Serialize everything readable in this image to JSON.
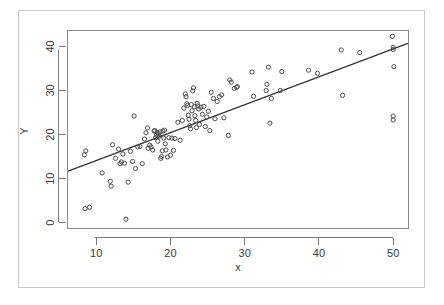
{
  "chart_data": {
    "type": "scatter",
    "title": "",
    "subtitle": "",
    "xlabel": "x",
    "ylabel": "Y",
    "xlim": [
      6.2,
      52.0
    ],
    "ylim": [
      -1.2,
      43.5
    ],
    "xticks": [
      10,
      20,
      30,
      40,
      50
    ],
    "yticks": [
      0,
      10,
      20,
      30,
      40
    ],
    "xtick_labels": [
      "10",
      "20",
      "30",
      "40",
      "50"
    ],
    "ytick_labels": [
      "0",
      "10",
      "20",
      "30",
      "40"
    ],
    "grid": false,
    "legend": "none",
    "marker": "open-circle",
    "marker_color": "#4d4d4d",
    "line_color": "#2b2b2b",
    "background": "#ffffff",
    "frame_color": "#8a8a8a",
    "outer_frame_color": "#c9c9c9",
    "series": [
      {
        "name": "observations",
        "type": "scatter",
        "points": [
          [
            8.4,
            15.4
          ],
          [
            8.6,
            16.3
          ],
          [
            8.5,
            3.2
          ],
          [
            9.1,
            3.5
          ],
          [
            10.8,
            11.3
          ],
          [
            11.9,
            9.4
          ],
          [
            12.0,
            8.3
          ],
          [
            12.2,
            17.7
          ],
          [
            12.6,
            14.6
          ],
          [
            13.0,
            16.7
          ],
          [
            13.2,
            13.4
          ],
          [
            13.4,
            13.8
          ],
          [
            13.6,
            15.6
          ],
          [
            13.8,
            13.5
          ],
          [
            14.0,
            0.8
          ],
          [
            14.3,
            9.2
          ],
          [
            14.6,
            16.2
          ],
          [
            14.9,
            13.9
          ],
          [
            15.1,
            24.2
          ],
          [
            15.3,
            12.3
          ],
          [
            15.6,
            17.2
          ],
          [
            15.9,
            17.3
          ],
          [
            16.2,
            13.4
          ],
          [
            16.5,
            19.0
          ],
          [
            16.7,
            20.4
          ],
          [
            16.9,
            21.5
          ],
          [
            17.0,
            16.9
          ],
          [
            17.2,
            17.6
          ],
          [
            17.4,
            17.2
          ],
          [
            17.6,
            16.5
          ],
          [
            17.8,
            20.8
          ],
          [
            17.9,
            20.9
          ],
          [
            18.0,
            19.3
          ],
          [
            18.1,
            19.9
          ],
          [
            18.2,
            20.5
          ],
          [
            18.3,
            18.5
          ],
          [
            18.4,
            20.2
          ],
          [
            18.5,
            19.6
          ],
          [
            18.6,
            20.6
          ],
          [
            18.7,
            14.6
          ],
          [
            18.8,
            15.0
          ],
          [
            18.9,
            16.3
          ],
          [
            19.0,
            20.8
          ],
          [
            19.1,
            19.2
          ],
          [
            19.2,
            21.0
          ],
          [
            19.3,
            17.9
          ],
          [
            19.4,
            16.5
          ],
          [
            19.6,
            14.9
          ],
          [
            19.8,
            19.3
          ],
          [
            20.0,
            15.3
          ],
          [
            20.2,
            19.2
          ],
          [
            20.4,
            16.4
          ],
          [
            20.6,
            19.1
          ],
          [
            21.0,
            22.8
          ],
          [
            21.3,
            18.7
          ],
          [
            21.6,
            23.2
          ],
          [
            21.8,
            26.0
          ],
          [
            22.0,
            29.2
          ],
          [
            22.1,
            28.6
          ],
          [
            22.2,
            27.0
          ],
          [
            22.3,
            26.6
          ],
          [
            22.4,
            24.4
          ],
          [
            22.5,
            23.5
          ],
          [
            22.6,
            22.0
          ],
          [
            22.7,
            21.3
          ],
          [
            22.8,
            26.8
          ],
          [
            22.9,
            25.4
          ],
          [
            23.0,
            29.9
          ],
          [
            23.1,
            30.6
          ],
          [
            23.2,
            26.3
          ],
          [
            23.3,
            24.3
          ],
          [
            23.4,
            23.2
          ],
          [
            23.5,
            21.6
          ],
          [
            23.6,
            27.1
          ],
          [
            23.7,
            26.5
          ],
          [
            23.8,
            25.8
          ],
          [
            23.9,
            22.3
          ],
          [
            24.1,
            26.2
          ],
          [
            24.3,
            24.6
          ],
          [
            24.5,
            26.4
          ],
          [
            24.7,
            21.8
          ],
          [
            24.9,
            24.0
          ],
          [
            25.1,
            25.3
          ],
          [
            25.3,
            20.9
          ],
          [
            25.5,
            29.6
          ],
          [
            25.8,
            28.2
          ],
          [
            26.0,
            23.6
          ],
          [
            26.3,
            27.5
          ],
          [
            26.6,
            28.6
          ],
          [
            26.9,
            29.0
          ],
          [
            27.2,
            23.8
          ],
          [
            27.8,
            19.8
          ],
          [
            28.0,
            32.4
          ],
          [
            28.2,
            31.9
          ],
          [
            28.6,
            30.5
          ],
          [
            28.9,
            30.7
          ],
          [
            29.0,
            30.9
          ],
          [
            31.0,
            34.2
          ],
          [
            31.2,
            28.7
          ],
          [
            32.9,
            30.0
          ],
          [
            33.0,
            31.4
          ],
          [
            33.2,
            35.3
          ],
          [
            33.4,
            22.6
          ],
          [
            33.6,
            28.2
          ],
          [
            34.8,
            30.0
          ],
          [
            35.0,
            34.3
          ],
          [
            38.6,
            34.6
          ],
          [
            39.8,
            33.9
          ],
          [
            43.0,
            39.2
          ],
          [
            43.2,
            28.9
          ],
          [
            45.5,
            38.6
          ],
          [
            49.9,
            42.3
          ],
          [
            50.0,
            39.8
          ],
          [
            50.0,
            39.3
          ],
          [
            50.1,
            35.4
          ],
          [
            50.0,
            24.2
          ],
          [
            50.0,
            23.3
          ]
        ]
      }
    ],
    "fit_line": {
      "name": "regression-line",
      "type": "line",
      "x_start": 6.2,
      "y_start": 11.7,
      "x_end": 52.0,
      "y_end": 40.7,
      "slope": 0.633,
      "intercept": 7.78
    }
  }
}
